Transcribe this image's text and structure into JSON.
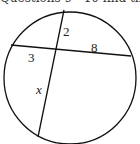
{
  "header": {
    "text": "Questions 9 - 10 find the v"
  },
  "diagram": {
    "type": "intersecting-chords-in-circle",
    "labels": {
      "segment_top": "2",
      "segment_right": "8",
      "segment_left": "3",
      "segment_bottom": "x"
    }
  }
}
